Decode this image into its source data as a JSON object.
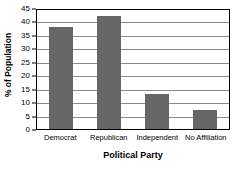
{
  "chart_data": {
    "type": "bar",
    "title": "",
    "categories": [
      "Democrat",
      "Republican",
      "Independent",
      "No Affiliation"
    ],
    "values": [
      38,
      42,
      13,
      7
    ],
    "xlabel": "Political Party",
    "ylabel": "% of Population",
    "ylim": [
      0,
      45
    ],
    "ytick_step": 5,
    "yticks": [
      0,
      5,
      10,
      15,
      20,
      25,
      30,
      35,
      40,
      45
    ],
    "ytick_labels": [
      "0",
      "5",
      "10",
      "15",
      "20",
      "25",
      "30",
      "35",
      "40",
      "45"
    ],
    "grid": true,
    "grid_orientation": "horizontal",
    "legend": false,
    "legend_position": "none",
    "bar_color": "#666666",
    "grid_color": "#8A8A8A",
    "frame_color": "#000000",
    "background_color": "#FFFFFF"
  }
}
